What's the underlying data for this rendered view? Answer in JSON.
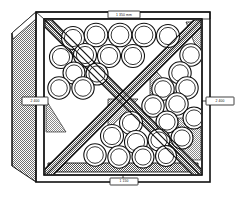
{
  "figure": {
    "view": "isometric-front",
    "labels": {
      "top": "1 350 mm",
      "left": "2 400",
      "right": "2 400",
      "bottom": "1 150"
    },
    "colors": {
      "line": "#111111",
      "paper": "#ffffff",
      "drum_fill": "#ffffff",
      "brace_fill": "#9a9a9a",
      "panel_fill": "#b4b4b4",
      "floor_fill": "#8f8f8f",
      "wedge_fill": "#a8a8a8"
    },
    "geometry": {
      "outer_frame": {
        "x": 36,
        "y": 12,
        "w": 174,
        "h": 170
      },
      "inner_frame": {
        "x": 44,
        "y": 19,
        "w": 158,
        "h": 156
      },
      "side_panel_depth": 27,
      "brace_width": 9
    },
    "drums": {
      "count": 30,
      "outer_radius": 11.5,
      "inner_radius": 8.6,
      "items": [
        {
          "cx": 73,
          "cy": 38,
          "r": 11.5,
          "q": "top"
        },
        {
          "cx": 96,
          "cy": 35,
          "r": 11.8,
          "q": "top"
        },
        {
          "cx": 120,
          "cy": 35,
          "r": 11.8,
          "q": "top"
        },
        {
          "cx": 144,
          "cy": 35,
          "r": 11.8,
          "q": "top"
        },
        {
          "cx": 168,
          "cy": 36,
          "r": 11.5,
          "q": "top"
        },
        {
          "cx": 61,
          "cy": 57,
          "r": 11.5,
          "q": "left"
        },
        {
          "cx": 85,
          "cy": 55,
          "r": 11.5,
          "q": "top"
        },
        {
          "cx": 109,
          "cy": 56,
          "r": 11.5,
          "q": "top"
        },
        {
          "cx": 133,
          "cy": 56,
          "r": 11.5,
          "q": "top"
        },
        {
          "cx": 191,
          "cy": 55,
          "r": 11.2,
          "q": "right"
        },
        {
          "cx": 74,
          "cy": 73,
          "r": 11.0,
          "q": "left"
        },
        {
          "cx": 97,
          "cy": 74,
          "r": 11.0,
          "q": "left"
        },
        {
          "cx": 180,
          "cy": 73,
          "r": 11.2,
          "q": "right"
        },
        {
          "cx": 59,
          "cy": 88,
          "r": 11.2,
          "q": "left"
        },
        {
          "cx": 83,
          "cy": 88,
          "r": 11.2,
          "q": "left"
        },
        {
          "cx": 163,
          "cy": 89,
          "r": 11.2,
          "q": "right"
        },
        {
          "cx": 187,
          "cy": 88,
          "r": 11.2,
          "q": "right"
        },
        {
          "cx": 153,
          "cy": 106,
          "r": 11.2,
          "q": "right"
        },
        {
          "cx": 177,
          "cy": 104,
          "r": 11.2,
          "q": "right"
        },
        {
          "cx": 194,
          "cy": 118,
          "r": 11.0,
          "q": "right"
        },
        {
          "cx": 167,
          "cy": 122,
          "r": 11.0,
          "q": "right"
        },
        {
          "cx": 131,
          "cy": 123,
          "r": 11.5,
          "q": "bottom"
        },
        {
          "cx": 112,
          "cy": 136,
          "r": 11.5,
          "q": "bottom"
        },
        {
          "cx": 136,
          "cy": 142,
          "r": 11.5,
          "q": "bottom"
        },
        {
          "cx": 159,
          "cy": 140,
          "r": 11.0,
          "q": "bottom"
        },
        {
          "cx": 182,
          "cy": 138,
          "r": 11.0,
          "q": "right"
        },
        {
          "cx": 95,
          "cy": 155,
          "r": 11.2,
          "q": "bottom"
        },
        {
          "cx": 119,
          "cy": 157,
          "r": 11.2,
          "q": "bottom"
        },
        {
          "cx": 143,
          "cy": 157,
          "r": 11.0,
          "q": "bottom"
        },
        {
          "cx": 166,
          "cy": 156,
          "r": 10.5,
          "q": "bottom"
        }
      ]
    }
  }
}
